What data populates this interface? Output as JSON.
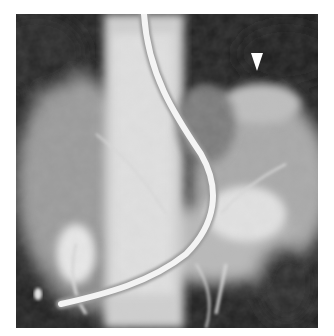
{
  "figure": {
    "type": "radiograph",
    "modality": "angiogram (grayscale X-ray)",
    "annotations": [
      {
        "kind": "arrowhead",
        "direction": "down",
        "color": "#ffffff"
      }
    ],
    "visible_objects": [
      "catheter",
      "vertebral column",
      "contrast-filled vessels"
    ]
  }
}
